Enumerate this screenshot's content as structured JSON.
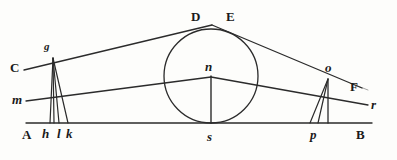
{
  "figure": {
    "kind": "geometric-optics-ray-diagram",
    "width": 397,
    "height": 160,
    "background_color": "#fdfdfb",
    "ink_color": "#2b2b2b"
  },
  "labels": [
    {
      "id": "C",
      "text": "C",
      "style": "upright",
      "x": 10,
      "y": 61,
      "point_x": 26,
      "point_y": 67
    },
    {
      "id": "g",
      "text": "g",
      "style": "italic-sm",
      "x": 44,
      "y": 41,
      "point_x": 52,
      "point_y": 56
    },
    {
      "id": "D",
      "text": "D",
      "style": "upright",
      "x": 191,
      "y": 10,
      "point_x": 203,
      "point_y": 26
    },
    {
      "id": "E",
      "text": "E",
      "style": "upright",
      "x": 226,
      "y": 10,
      "point_x": 222,
      "point_y": 26
    },
    {
      "id": "F",
      "text": "F",
      "style": "upright",
      "x": 350,
      "y": 80,
      "point_x": 366,
      "point_y": 88
    },
    {
      "id": "o",
      "text": "o",
      "style": "italic",
      "x": 325,
      "y": 61,
      "point_x": 328,
      "point_y": 77
    },
    {
      "id": "n",
      "text": "n",
      "style": "italic",
      "x": 205,
      "y": 60,
      "point_x": 211,
      "point_y": 76
    },
    {
      "id": "m",
      "text": "m",
      "style": "italic",
      "x": 12,
      "y": 93,
      "point_x": 30,
      "point_y": 101
    },
    {
      "id": "r",
      "text": "r",
      "style": "italic",
      "x": 371,
      "y": 98,
      "point_x": 366,
      "point_y": 105
    },
    {
      "id": "A",
      "text": "A",
      "style": "upright",
      "x": 22,
      "y": 128,
      "point_x": 30,
      "point_y": 123
    },
    {
      "id": "h",
      "text": "h",
      "style": "italic",
      "x": 42,
      "y": 127,
      "point_x": 50,
      "point_y": 123
    },
    {
      "id": "l",
      "text": "l",
      "style": "italic",
      "x": 57,
      "y": 127,
      "point_x": 59,
      "point_y": 123
    },
    {
      "id": "k",
      "text": "k",
      "style": "italic",
      "x": 66,
      "y": 127,
      "point_x": 67,
      "point_y": 123
    },
    {
      "id": "s",
      "text": "s",
      "style": "italic",
      "x": 207,
      "y": 130,
      "point_x": 211,
      "point_y": 123
    },
    {
      "id": "p",
      "text": "p",
      "style": "italic",
      "x": 310,
      "y": 128,
      "point_x": 314,
      "point_y": 123
    },
    {
      "id": "B",
      "text": "B",
      "style": "upright",
      "x": 356,
      "y": 128,
      "point_x": 362,
      "point_y": 123
    }
  ],
  "geometry": {
    "baseline": {
      "x1": 26,
      "y1": 123,
      "x2": 372,
      "y2": 123
    },
    "circle": {
      "cx": 211,
      "cy": 76,
      "r": 47
    },
    "apex": {
      "x": 212,
      "y": 25
    },
    "upper_left_ray": {
      "x1": 24,
      "y1": 70,
      "x2": 212,
      "y2": 25
    },
    "upper_right_ray": {
      "x1": 212,
      "y1": 25,
      "x2": 362,
      "y2": 88
    },
    "mid_left_ray": {
      "x1": 26,
      "y1": 101,
      "x2": 211,
      "y2": 77
    },
    "mid_right_ray": {
      "x1": 211,
      "y1": 77,
      "x2": 368,
      "y2": 105
    },
    "center_drop": {
      "x1": 211,
      "y1": 76,
      "x2": 211,
      "y2": 123
    },
    "left_pencil_apex": {
      "x": 53,
      "y": 58
    },
    "left_pencil_feet": [
      {
        "x": 50,
        "y": 123
      },
      {
        "x": 59,
        "y": 123
      },
      {
        "x": 68,
        "y": 123
      }
    ],
    "right_pencil_apex": {
      "x": 328,
      "y": 79
    },
    "right_pencil_feet": [
      {
        "x": 310,
        "y": 123
      },
      {
        "x": 318,
        "y": 123
      },
      {
        "x": 328,
        "y": 123
      }
    ]
  }
}
